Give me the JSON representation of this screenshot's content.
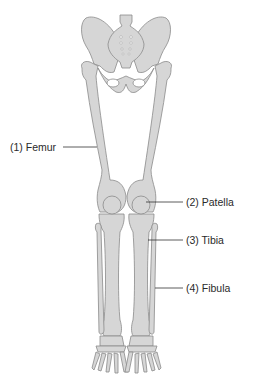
{
  "figure": {
    "colors": {
      "bone_fill": "#d6d6d6",
      "bone_stroke": "#8a8a8a",
      "leader_line": "#333333",
      "label_text": "#2a2a2a",
      "background": "#ffffff"
    }
  },
  "labels": [
    {
      "number": "(1)",
      "name": "Femur",
      "text": "(1) Femur"
    },
    {
      "number": "(2)",
      "name": "Patella",
      "text": "(2) Patella"
    },
    {
      "number": "(3)",
      "name": "Tibia",
      "text": "(3) Tibia"
    },
    {
      "number": "(4)",
      "name": "Fibula",
      "text": "(4) Fibula"
    }
  ]
}
